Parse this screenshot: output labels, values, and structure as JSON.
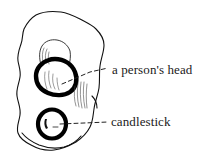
{
  "figure": {
    "kind": "hand-drawn-annotated-sketch",
    "background_color": "#ffffff",
    "ink_color": "#111111",
    "annotations": [
      {
        "id": "person-head",
        "label": "a person's head",
        "target": "thick-black-ring-upper",
        "leader_line": "dashed-diagonal"
      },
      {
        "id": "candlestick",
        "label": "candlestick",
        "target": "thick-black-ring-lower",
        "leader_line": "dashed-horizontal"
      }
    ]
  },
  "labels": {
    "head": "a person's head",
    "candlestick": "candlestick"
  }
}
